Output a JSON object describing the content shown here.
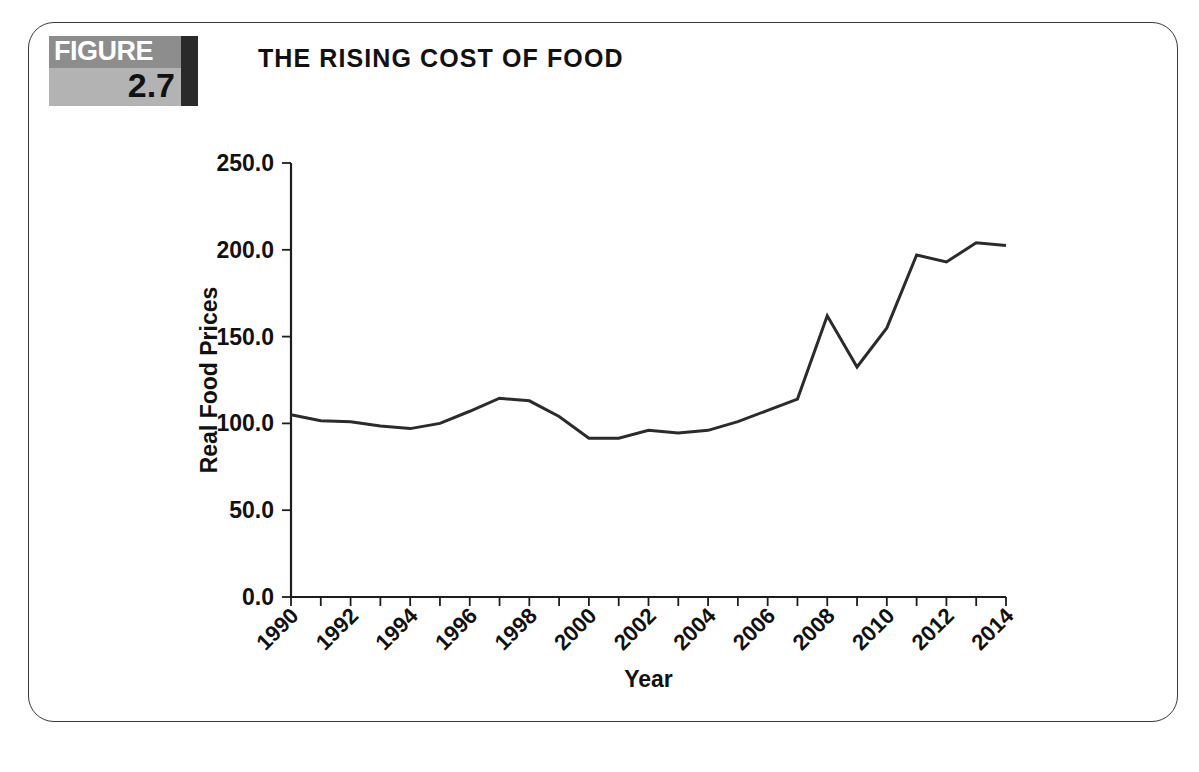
{
  "figure": {
    "badge_word": "FIGURE",
    "badge_number": "2.7",
    "title": "THE RISING COST OF FOOD"
  },
  "colors": {
    "badge_top_bg": "#8d8d8d",
    "badge_bottom_bg": "#b3b3b3",
    "badge_rightbar": "#2a2a2a",
    "badge_word_color": "#ffffff",
    "badge_number_color": "#111111",
    "line_color": "#2b2b2b",
    "axis_color": "#1d1d1d",
    "frame_border": "#3a3a3a",
    "page_bg": "#ffffff"
  },
  "chart_data": {
    "type": "line",
    "title": "THE RISING COST OF FOOD",
    "xlabel": "Year",
    "ylabel": "Real Food Prices",
    "xlim": [
      1990,
      2014
    ],
    "ylim": [
      0,
      250
    ],
    "yticks": [
      0,
      50,
      100,
      150,
      200,
      250
    ],
    "ytick_labels": [
      "0.0",
      "50.0",
      "100.0",
      "150.0",
      "200.0",
      "250.0"
    ],
    "xtick_labels": [
      "1990",
      "1992",
      "1994",
      "1996",
      "1998",
      "2000",
      "2002",
      "2004",
      "2006",
      "2008",
      "2010",
      "2012",
      "2014"
    ],
    "xtick_label_step": 2,
    "xtick_minor_step": 1,
    "xtick_rotation_deg": 45,
    "grid": false,
    "legend": false,
    "x": [
      1990,
      1991,
      1992,
      1993,
      1994,
      1995,
      1996,
      1997,
      1998,
      1999,
      2000,
      2001,
      2002,
      2003,
      2004,
      2005,
      2006,
      2007,
      2008,
      2009,
      2010,
      2011,
      2012,
      2013,
      2014
    ],
    "values": [
      105.0,
      101.5,
      101.0,
      98.5,
      97.0,
      100.0,
      107.0,
      114.5,
      113.0,
      104.0,
      91.5,
      91.5,
      96.0,
      94.5,
      96.0,
      101.0,
      107.5,
      114.0,
      162.0,
      132.5,
      155.0,
      197.0,
      193.0,
      204.0,
      202.5
    ],
    "series_name": "Real Food Prices"
  },
  "bottom_caption": ""
}
